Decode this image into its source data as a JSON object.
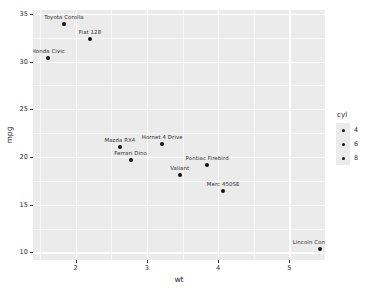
{
  "chart_data": {
    "type": "scatter",
    "title": "",
    "xlabel": "wt",
    "ylabel": "mpg",
    "xlim": [
      1.4,
      5.5
    ],
    "ylim": [
      9.2,
      35.4
    ],
    "xticks": [
      2,
      3,
      4,
      5
    ],
    "yticks": [
      10,
      15,
      20,
      25,
      30,
      35
    ],
    "grid": true,
    "panel_background": "#ebebeb",
    "gridline_color": "#ffffff",
    "point_color": "#141414",
    "points": [
      {
        "label": "Toyota Corolla",
        "x": 1.835,
        "y": 33.9,
        "cyl": 4
      },
      {
        "label": "Fiat 128",
        "x": 2.2,
        "y": 32.4,
        "cyl": 4
      },
      {
        "label": "Honda Civic",
        "x": 1.615,
        "y": 30.4,
        "cyl": 4
      },
      {
        "label": "Mazda RX4",
        "x": 2.62,
        "y": 21.0,
        "cyl": 6
      },
      {
        "label": "Hornet 4 Drive",
        "x": 3.215,
        "y": 21.4,
        "cyl": 6
      },
      {
        "label": "Ferrari Dino",
        "x": 2.77,
        "y": 19.7,
        "cyl": 6
      },
      {
        "label": "Valiant",
        "x": 3.46,
        "y": 18.1,
        "cyl": 6
      },
      {
        "label": "Pontiac Firebird",
        "x": 3.845,
        "y": 19.2,
        "cyl": 8
      },
      {
        "label": "Merc 450SE",
        "x": 4.07,
        "y": 16.4,
        "cyl": 8
      },
      {
        "label": "Lincoln Continental",
        "x": 5.424,
        "y": 10.4,
        "cyl": 8
      }
    ],
    "legend": {
      "title": "cyl",
      "position": "right",
      "entries": [
        {
          "label": "4",
          "value": 4
        },
        {
          "label": "6",
          "value": 6
        },
        {
          "label": "8",
          "value": 8
        }
      ]
    }
  }
}
